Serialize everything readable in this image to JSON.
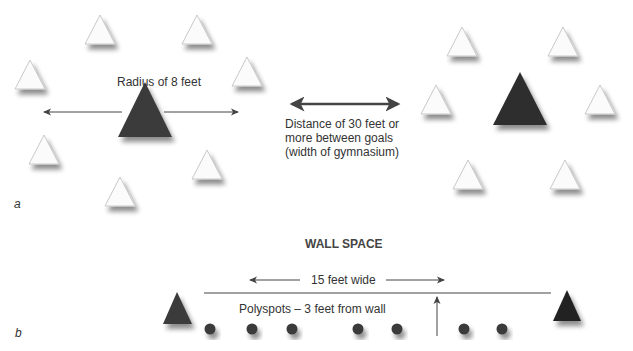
{
  "part_a": {
    "label": "a",
    "radius_label": "Radius of 8 feet",
    "distance_lines": [
      "Distance of 30 feet or",
      "more between goals",
      "(width of gymnasium)"
    ],
    "left_goal": {
      "cx": 145,
      "cy": 108,
      "color": "#3b3b3b"
    },
    "right_goal": {
      "cx": 520,
      "cy": 100,
      "color": "#2e2e2e"
    },
    "left_cones": [
      [
        100,
        30
      ],
      [
        197,
        30
      ],
      [
        30,
        75
      ],
      [
        247,
        72
      ],
      [
        44,
        150
      ],
      [
        207,
        165
      ],
      [
        120,
        192
      ]
    ],
    "right_cones": [
      [
        462,
        42
      ],
      [
        563,
        42
      ],
      [
        436,
        100
      ],
      [
        600,
        100
      ],
      [
        468,
        175
      ],
      [
        565,
        175
      ]
    ]
  },
  "part_b": {
    "label": "b",
    "title": "WALL SPACE",
    "width_label": "15 feet wide",
    "polyspots_label": "Polyspots – 3 feet from wall",
    "polyspot_x": [
      210,
      252,
      292,
      358,
      397,
      464,
      502
    ],
    "spot_color": "#3a3a3a"
  },
  "colors": {
    "dark_triangle": "#383838",
    "cone_fill": "#fbfbfb",
    "cone_stroke": "#c8c8c8",
    "arrow": "#444444"
  }
}
